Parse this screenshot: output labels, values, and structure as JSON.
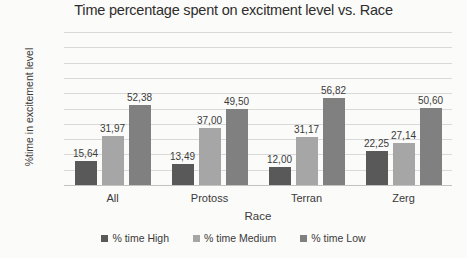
{
  "chart_data": {
    "type": "bar",
    "title": "Time percentage spent on excitment level vs. Race",
    "xlabel": "Race",
    "ylabel": "%time in excitement level",
    "categories": [
      "All",
      "Protoss",
      "Terran",
      "Zerg"
    ],
    "ylim": [
      0,
      100
    ],
    "yticks": [
      100,
      90,
      80,
      70,
      60,
      50,
      40,
      30,
      20,
      10,
      0
    ],
    "grid": true,
    "legend_position": "bottom",
    "decimal_separator": ",",
    "series": [
      {
        "name": "% time High",
        "color": "#595959",
        "values": [
          15.64,
          13.49,
          12.0,
          22.25
        ],
        "labels": [
          "15,64",
          "13,49",
          "12,00",
          "22,25"
        ]
      },
      {
        "name": "% time Medium",
        "color": "#a6a6a6",
        "values": [
          31.97,
          37.0,
          31.17,
          27.14
        ],
        "labels": [
          "31,97",
          "37,00",
          "31,17",
          "27,14"
        ]
      },
      {
        "name": "% time Low",
        "color": "#808080",
        "values": [
          52.38,
          49.5,
          56.82,
          50.6
        ],
        "labels": [
          "52,38",
          "49,50",
          "56,82",
          "50,60"
        ]
      }
    ]
  }
}
